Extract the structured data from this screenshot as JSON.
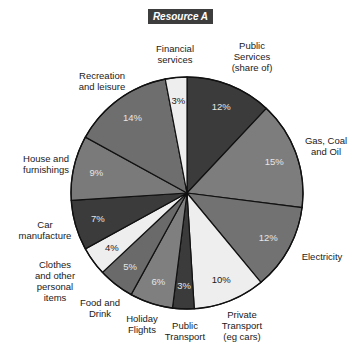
{
  "chart_data": {
    "type": "pie",
    "title": "Resource A",
    "start_angle": "12 o'clock, clockwise",
    "categories": [
      "Public Services (share of)",
      "Gas, Coal and Oil",
      "Electricity",
      "Private Transport (eg cars)",
      "Public Transport",
      "Holiday Flights",
      "Food and Drink",
      "Clothes and other personal items",
      "Car manufacture",
      "House and furnishings",
      "Recreation and leisure",
      "Financial services"
    ],
    "values": [
      12,
      15,
      12,
      10,
      3,
      6,
      5,
      4,
      7,
      9,
      14,
      3
    ],
    "unit": "%",
    "legend": "none (labels placed around pie)"
  },
  "title": "Resource A",
  "slices": [
    {
      "label_lines": [
        "Public",
        "Services",
        "(share of)"
      ],
      "value": 12,
      "pct": "12%",
      "color": "#3b3b3b",
      "text_color": "#e6e6e6"
    },
    {
      "label_lines": [
        "Gas, Coal",
        "and Oil"
      ],
      "value": 15,
      "pct": "15%",
      "color": "#7d7d7d",
      "text_color": "#e6e6e6"
    },
    {
      "label_lines": [
        "Electricity"
      ],
      "value": 12,
      "pct": "12%",
      "color": "#727272",
      "text_color": "#e6e6e6"
    },
    {
      "label_lines": [
        "Private",
        "Transport",
        "(eg cars)"
      ],
      "value": 10,
      "pct": "10%",
      "color": "#eeeeee",
      "text_color": "#1a1a1a"
    },
    {
      "label_lines": [
        "Public",
        "Transport"
      ],
      "value": 3,
      "pct": "3%",
      "color": "#3b3b3b",
      "text_color": "#e6e6e6"
    },
    {
      "label_lines": [
        "Holiday",
        "Flights"
      ],
      "value": 6,
      "pct": "6%",
      "color": "#7f7f7f",
      "text_color": "#e6e6e6"
    },
    {
      "label_lines": [
        "Food and",
        "Drink"
      ],
      "value": 5,
      "pct": "5%",
      "color": "#6a6a6a",
      "text_color": "#e6e6e6"
    },
    {
      "label_lines": [
        "Clothes",
        "and other",
        "personal",
        "items"
      ],
      "value": 4,
      "pct": "4%",
      "color": "#eeeeee",
      "text_color": "#1a1a1a"
    },
    {
      "label_lines": [
        "Car",
        "manufacture"
      ],
      "value": 7,
      "pct": "7%",
      "color": "#3b3b3b",
      "text_color": "#e6e6e6"
    },
    {
      "label_lines": [
        "House and",
        "furnishings"
      ],
      "value": 9,
      "pct": "9%",
      "color": "#7a7a7a",
      "text_color": "#e6e6e6"
    },
    {
      "label_lines": [
        "Recreation",
        "and leisure"
      ],
      "value": 14,
      "pct": "14%",
      "color": "#6e6e6e",
      "text_color": "#e6e6e6"
    },
    {
      "label_lines": [
        "Financial",
        "services"
      ],
      "value": 3,
      "pct": "3%",
      "color": "#eeeeee",
      "text_color": "#1a1a1a"
    }
  ],
  "labels": {
    "public_services": "Public\nServices\n(share of)",
    "gas": "Gas, Coal\nand Oil",
    "electricity": "Electricity",
    "private_transport": "Private\nTransport\n(eg cars)",
    "public_transport": "Public\nTransport",
    "holiday_flights": "Holiday\nFlights",
    "food": "Food and\nDrink",
    "clothes": "Clothes\nand other\npersonal\nitems",
    "car": "Car\nmanufacture",
    "house": "House and\nfurnishings",
    "recreation": "Recreation\nand leisure",
    "financial": "Financial\nservices"
  }
}
